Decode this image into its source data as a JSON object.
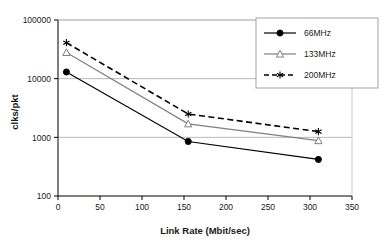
{
  "chart_data": {
    "type": "line",
    "title": "",
    "xlabel": "Link Rate (Mbit/sec)",
    "ylabel": "clks/pkt",
    "xlim": [
      0,
      350
    ],
    "ylim": [
      100,
      100000
    ],
    "yscale": "log",
    "grid": true,
    "legend_position": "top-right",
    "xticks": [
      "0",
      "50",
      "100",
      "150",
      "200",
      "250",
      "300",
      "350"
    ],
    "xtick_values": [
      0,
      50,
      100,
      150,
      200,
      250,
      300,
      350
    ],
    "yticks": [
      "100",
      "1000",
      "10000",
      "100000"
    ],
    "ytick_values": [
      100,
      1000,
      10000,
      100000
    ],
    "x": [
      10,
      155,
      310
    ],
    "series": [
      {
        "name": "66MHz",
        "label": "66MHz",
        "values": [
          13000,
          850,
          420
        ],
        "color": "#000000",
        "dash": "none",
        "marker": "filled-circle"
      },
      {
        "name": "133MHz",
        "label": "133MHz",
        "values": [
          28000,
          1700,
          880
        ],
        "color": "#808080",
        "dash": "none",
        "marker": "open-triangle"
      },
      {
        "name": "200MHz",
        "label": "200MHz",
        "values": [
          41000,
          2500,
          1250
        ],
        "color": "#000000",
        "dash": "dashed",
        "marker": "asterisk"
      }
    ]
  },
  "legend": {
    "entries": [
      "66MHz",
      "133MHz",
      "200MHz"
    ]
  },
  "axes": {
    "x_title": "Link Rate (Mbit/sec)",
    "y_title": "clks/pkt"
  },
  "colors": {
    "axis": "#000000",
    "grid": "#a6a6a6",
    "series_66": "#000000",
    "series_133": "#808080",
    "series_200": "#000000",
    "background": "#ffffff"
  }
}
